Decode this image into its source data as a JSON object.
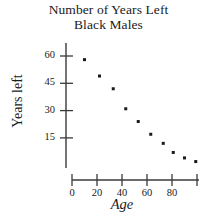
{
  "chart_data": {
    "type": "scatter",
    "title": "Number of Years Left",
    "subtitle": "Black Males",
    "title_lines": [
      "Number of Years Left",
      "Black Males"
    ],
    "xlabel": "Age",
    "ylabel": "Years left",
    "grid": false,
    "legend": false,
    "legend_position": "none",
    "xlim": [
      0,
      100
    ],
    "ylim": [
      0,
      66
    ],
    "xticks": [
      0,
      20,
      40,
      60,
      80,
      100
    ],
    "xtick_labels": [
      "0",
      "20",
      "40",
      "60",
      "80",
      ""
    ],
    "yticks": [
      15,
      30,
      45,
      60
    ],
    "ytick_labels": [
      "15",
      "30",
      "45",
      "60"
    ],
    "marker": "square-dot",
    "marker_color": "#1a1a1a",
    "axis_color": "#3a3a3a",
    "background": "#ffffff",
    "x": [
      10,
      22,
      33,
      43,
      53,
      63,
      73,
      81,
      90,
      99
    ],
    "y": [
      58,
      49,
      42,
      31,
      24,
      17,
      12,
      7,
      4,
      2
    ],
    "points": [
      {
        "x": 10,
        "y": 58
      },
      {
        "x": 22,
        "y": 49
      },
      {
        "x": 33,
        "y": 42
      },
      {
        "x": 43,
        "y": 31
      },
      {
        "x": 53,
        "y": 24
      },
      {
        "x": 63,
        "y": 17
      },
      {
        "x": 73,
        "y": 12
      },
      {
        "x": 81,
        "y": 7
      },
      {
        "x": 90,
        "y": 4
      },
      {
        "x": 99,
        "y": 2
      }
    ]
  }
}
